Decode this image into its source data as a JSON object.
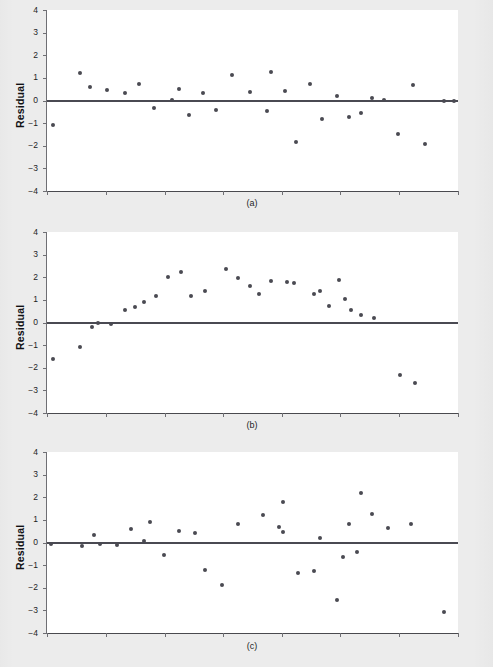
{
  "figure": {
    "background_color": "#ececec",
    "plot_background_color": "#ffffff",
    "point_color": "#4a4a52",
    "axis_color": "#6f6f74",
    "zero_line_color": "#4a4a52"
  },
  "panels": [
    {
      "caption": "(a)",
      "axis_title": "Residual",
      "chart_data": {
        "type": "scatter",
        "title": "",
        "xlabel": "",
        "ylabel": "Residual",
        "ylim": [
          -4,
          4
        ],
        "xlim": [
          0,
          100
        ],
        "yticks": [
          4,
          3,
          2,
          1,
          0,
          -1,
          -2,
          -3,
          -4
        ],
        "ytick_labels": [
          "4",
          "3",
          "2",
          "1",
          "0",
          "−1",
          "−2",
          "−3",
          "−4"
        ],
        "xticks": [
          0,
          14.3,
          28.6,
          42.9,
          57.1,
          71.4,
          85.7,
          100
        ],
        "xtick_labels": [],
        "grid": false,
        "legend": null,
        "reference_line": {
          "y": 0,
          "style": "solid"
        },
        "pattern": "random scatter about zero (well-behaved residuals)",
        "x": [
          1.5,
          8.0,
          10.5,
          14.5,
          19.0,
          22.5,
          26.0,
          30.5,
          32.0,
          34.5,
          38.0,
          41.0,
          45.0,
          49.5,
          53.5,
          54.5,
          58.0,
          60.5,
          64.0,
          67.0,
          70.5,
          73.5,
          76.5,
          79.0,
          82.0,
          85.5,
          89.0,
          92.0,
          96.5,
          99.0
        ],
        "y": [
          -1.1,
          1.2,
          0.58,
          0.47,
          0.32,
          0.72,
          -0.35,
          0.02,
          0.52,
          -0.62,
          0.34,
          -0.4,
          1.12,
          0.37,
          -0.45,
          1.25,
          0.43,
          -1.82,
          0.72,
          -0.82,
          0.18,
          -0.75,
          -0.56,
          0.09,
          0.02,
          -1.5,
          0.68,
          -1.93,
          0.0,
          0.0
        ]
      }
    },
    {
      "caption": "(b)",
      "axis_title": "Residual",
      "chart_data": {
        "type": "scatter",
        "title": "",
        "xlabel": "",
        "ylabel": "Residual",
        "ylim": [
          -4,
          4
        ],
        "xlim": [
          0,
          100
        ],
        "yticks": [
          4,
          3,
          2,
          1,
          0,
          -1,
          -2,
          -3,
          -4
        ],
        "ytick_labels": [
          "4",
          "3",
          "2",
          "1",
          "0",
          "−1",
          "−2",
          "−3",
          "−4"
        ],
        "xticks": [
          0,
          14.3,
          28.6,
          42.9,
          57.1,
          71.4,
          85.7,
          100
        ],
        "xtick_labels": [],
        "grid": false,
        "legend": null,
        "reference_line": {
          "y": 0,
          "style": "solid"
        },
        "pattern": "curved / inverted-U pattern indicating missing quadratic term",
        "x": [
          1.5,
          8.0,
          11.0,
          12.5,
          15.5,
          19.0,
          21.5,
          23.5,
          26.5,
          29.5,
          32.5,
          35.0,
          38.5,
          43.5,
          46.5,
          49.5,
          51.5,
          54.5,
          58.5,
          60.0,
          65.0,
          66.5,
          68.5,
          71.0,
          72.5,
          74.0,
          76.5,
          79.5,
          86.0,
          89.5
        ],
        "y": [
          -1.62,
          -1.1,
          -0.22,
          -0.02,
          -0.08,
          0.57,
          0.7,
          0.92,
          1.15,
          2.0,
          2.21,
          1.19,
          1.4,
          2.37,
          1.96,
          1.63,
          1.27,
          1.84,
          1.78,
          1.75,
          1.24,
          1.4,
          0.73,
          1.87,
          1.06,
          0.56,
          0.34,
          0.22,
          -2.33,
          -2.67
        ]
      }
    },
    {
      "caption": "(c)",
      "axis_title": "Residual",
      "chart_data": {
        "type": "scatter",
        "title": "",
        "xlabel": "",
        "ylabel": "Residual",
        "ylim": [
          -4,
          4
        ],
        "xlim": [
          0,
          100
        ],
        "yticks": [
          4,
          3,
          2,
          1,
          0,
          -1,
          -2,
          -3,
          -4
        ],
        "ytick_labels": [
          "4",
          "3",
          "2",
          "1",
          "0",
          "−1",
          "−2",
          "−3",
          "−4"
        ],
        "xticks": [
          0,
          14.3,
          28.6,
          42.9,
          57.1,
          71.4,
          85.7,
          100
        ],
        "xtick_labels": [],
        "grid": false,
        "legend": null,
        "reference_line": {
          "y": 0,
          "style": "solid"
        },
        "pattern": "fanning / megaphone shape showing non-constant variance",
        "x": [
          1.0,
          8.5,
          11.5,
          13.0,
          17.0,
          20.5,
          23.5,
          25.0,
          28.5,
          32.0,
          36.0,
          38.5,
          42.5,
          46.5,
          52.5,
          56.5,
          57.5,
          57.5,
          61.0,
          65.0,
          66.5,
          70.5,
          72.0,
          73.5,
          75.5,
          76.5,
          79.0,
          83.0,
          88.5,
          96.5
        ],
        "y": [
          -0.05,
          -0.15,
          0.32,
          -0.08,
          -0.1,
          0.58,
          0.07,
          0.92,
          -0.57,
          0.5,
          0.4,
          -1.22,
          -1.87,
          0.8,
          1.21,
          0.67,
          0.48,
          1.78,
          -1.37,
          -1.27,
          0.18,
          -2.55,
          -0.65,
          0.8,
          -0.44,
          2.2,
          1.26,
          0.65,
          0.82,
          -3.08
        ]
      }
    }
  ]
}
